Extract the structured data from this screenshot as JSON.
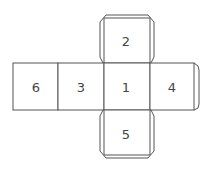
{
  "diagram": {
    "type": "cube-net",
    "faces": [
      {
        "id": "top",
        "label": "2"
      },
      {
        "id": "left-far",
        "label": "6"
      },
      {
        "id": "left",
        "label": "3"
      },
      {
        "id": "center",
        "label": "1"
      },
      {
        "id": "right",
        "label": "4"
      },
      {
        "id": "bottom",
        "label": "5"
      }
    ],
    "colors": {
      "stroke": "#555555",
      "fill": "#ffffff",
      "text": "#444444"
    }
  }
}
